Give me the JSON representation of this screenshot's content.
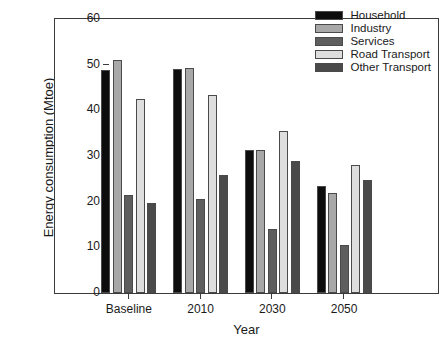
{
  "chart_data": {
    "type": "bar",
    "title": "",
    "xlabel": "Year",
    "ylabel": "Energy consumption (Mtoe)",
    "categories": [
      "Baseline",
      "2010",
      "2030",
      "2050"
    ],
    "ylim": [
      0,
      60
    ],
    "yticks": [
      0,
      10,
      20,
      30,
      40,
      50,
      60
    ],
    "ytick_labels": [
      "0",
      "10",
      "20",
      "30",
      "40",
      "50",
      "60"
    ],
    "grid": false,
    "legend_position": "top-right",
    "series": [
      {
        "name": "Household",
        "color": "#0d0d0d",
        "values": [
          48.9,
          49.1,
          31.3,
          23.5
        ]
      },
      {
        "name": "Industry",
        "color": "#a8a8a8",
        "values": [
          51.0,
          49.2,
          31.4,
          21.9
        ]
      },
      {
        "name": "Services",
        "color": "#5e5e5e",
        "values": [
          21.4,
          20.5,
          14.1,
          10.6
        ]
      },
      {
        "name": "Road Transport",
        "color": "#dedede",
        "values": [
          42.4,
          43.3,
          35.5,
          28.0
        ]
      },
      {
        "name": "Other Transport",
        "color": "#4a4a4a",
        "values": [
          19.7,
          25.9,
          29.0,
          24.7
        ]
      }
    ]
  }
}
